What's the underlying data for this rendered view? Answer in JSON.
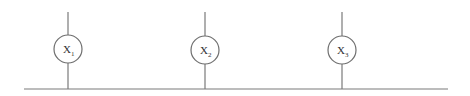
{
  "diagram": {
    "bus": {
      "label": ""
    },
    "nodes": [
      {
        "id": "x1",
        "label": "X",
        "subscript": "1"
      },
      {
        "id": "x2",
        "label": "X",
        "subscript": "2"
      },
      {
        "id": "x3",
        "label": "X",
        "subscript": "3"
      }
    ],
    "colors": {
      "line": "#7a7a7a",
      "circle": "#6e6e6e",
      "text": "#333333",
      "background": "#ffffff"
    }
  }
}
